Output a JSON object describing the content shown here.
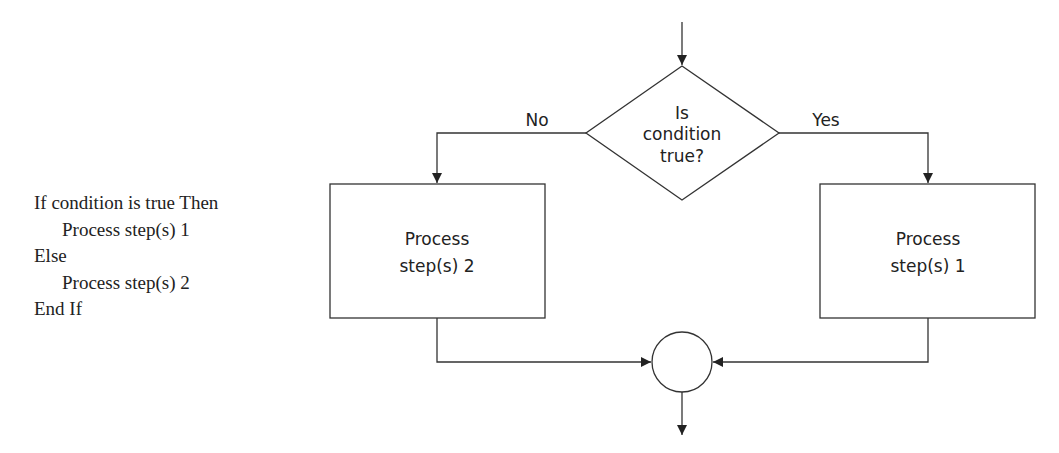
{
  "pseudocode": {
    "lines": [
      {
        "text": "If condition is true Then",
        "indent": 0
      },
      {
        "text": "Process step(s) 1",
        "indent": 1
      },
      {
        "text": "Else",
        "indent": 0
      },
      {
        "text": "Process step(s) 2",
        "indent": 1
      },
      {
        "text": "End If",
        "indent": 0
      }
    ]
  },
  "flowchart": {
    "decision": {
      "line1": "Is",
      "line2": "condition",
      "line3": "true?"
    },
    "branch_no_label": "No",
    "branch_yes_label": "Yes",
    "process_left": {
      "line1": "Process",
      "line2": "step(s) 2"
    },
    "process_right": {
      "line1": "Process",
      "line2": "step(s) 1"
    },
    "connector": "merge-circle"
  },
  "colors": {
    "stroke": "#333333",
    "background": "#ffffff"
  }
}
